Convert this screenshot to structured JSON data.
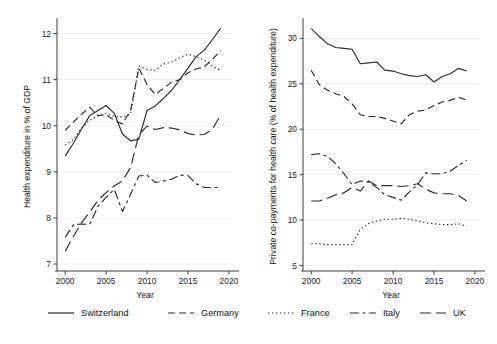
{
  "figure": {
    "title": "",
    "panels": 2,
    "background": "#ffffff",
    "line_color": "#2b2b2b"
  },
  "legend": {
    "position": "bottom",
    "entries": [
      {
        "label": "Switzerland",
        "style": "solid",
        "dash": "none"
      },
      {
        "label": "Germany",
        "style": "dashed",
        "dash": "7,4"
      },
      {
        "label": "France",
        "style": "dotted",
        "dash": "1.4,2.6"
      },
      {
        "label": "Italy",
        "style": "dash-dot",
        "dash": "9,3.5,3,3.5"
      },
      {
        "label": "UK",
        "style": "long-dash",
        "dash": "11,5"
      }
    ]
  },
  "chart_data": [
    {
      "type": "line",
      "panel": "left",
      "title": "",
      "xlabel": "Year",
      "ylabel": "Health expenditure in % of GDP",
      "xlim": [
        1999,
        2020.5
      ],
      "ylim": [
        6.85,
        12.25
      ],
      "xticks": [
        2000,
        2005,
        2010,
        2015,
        2020
      ],
      "yticks": [
        7,
        8,
        9,
        10,
        11,
        12
      ],
      "grid": "horizontal",
      "legend_position": "bottom",
      "x": [
        2000,
        2001,
        2002,
        2003,
        2004,
        2005,
        2006,
        2007,
        2008,
        2009,
        2010,
        2011,
        2012,
        2013,
        2014,
        2015,
        2016,
        2017,
        2018,
        2019
      ],
      "series": [
        {
          "name": "Switzerland",
          "style": "solid",
          "values": [
            9.34,
            9.62,
            9.93,
            10.22,
            10.33,
            10.44,
            10.27,
            9.82,
            9.67,
            9.71,
            10.33,
            10.43,
            10.59,
            10.77,
            11.0,
            11.25,
            11.5,
            11.64,
            11.87,
            12.12
          ]
        },
        {
          "name": "Germany",
          "style": "dashed",
          "values": [
            9.9,
            10.08,
            10.25,
            10.4,
            10.22,
            10.24,
            10.12,
            10.04,
            10.34,
            11.25,
            10.89,
            10.68,
            10.81,
            10.94,
            11.0,
            11.15,
            11.23,
            11.28,
            11.44,
            11.63
          ]
        },
        {
          "name": "France",
          "style": "dotted",
          "values": [
            9.58,
            9.7,
            9.95,
            10.12,
            10.22,
            10.27,
            10.2,
            10.19,
            10.25,
            11.3,
            11.22,
            11.2,
            11.34,
            11.38,
            11.48,
            11.55,
            11.5,
            11.42,
            11.29,
            11.2
          ]
        },
        {
          "name": "Italy",
          "style": "dash-dot",
          "values": [
            7.58,
            7.85,
            7.87,
            7.86,
            8.25,
            8.45,
            8.62,
            8.14,
            8.52,
            8.91,
            8.93,
            8.77,
            8.8,
            8.84,
            8.93,
            8.92,
            8.74,
            8.66,
            8.66,
            8.66
          ]
        },
        {
          "name": "UK",
          "style": "long-dash",
          "values": [
            7.28,
            7.6,
            7.9,
            8.13,
            8.38,
            8.55,
            8.7,
            8.8,
            9.1,
            9.81,
            9.99,
            9.92,
            9.96,
            9.95,
            9.91,
            9.83,
            9.8,
            9.81,
            9.93,
            10.24
          ]
        }
      ]
    },
    {
      "type": "line",
      "panel": "right",
      "title": "",
      "xlabel": "Year",
      "ylabel": "Private co-payments for health care (% of health expenditure)",
      "xlim": [
        1999,
        2020.5
      ],
      "ylim": [
        4.4,
        31.8
      ],
      "xticks": [
        2000,
        2005,
        2010,
        2015,
        2020
      ],
      "yticks": [
        5,
        10,
        15,
        20,
        25,
        30
      ],
      "grid": "horizontal",
      "legend_position": "bottom",
      "x": [
        2000,
        2001,
        2002,
        2003,
        2004,
        2005,
        2006,
        2007,
        2008,
        2009,
        2010,
        2011,
        2012,
        2013,
        2014,
        2015,
        2016,
        2017,
        2018,
        2019
      ],
      "series": [
        {
          "name": "Switzerland",
          "style": "solid",
          "values": [
            31.1,
            30.2,
            29.4,
            29.0,
            28.9,
            28.8,
            27.2,
            27.3,
            27.4,
            26.5,
            26.4,
            26.1,
            25.9,
            25.8,
            26.0,
            25.2,
            25.8,
            26.1,
            26.7,
            26.4
          ]
        },
        {
          "name": "Germany",
          "style": "dashed",
          "values": [
            26.5,
            24.9,
            24.3,
            23.9,
            23.6,
            22.8,
            21.6,
            21.4,
            21.4,
            21.2,
            20.9,
            20.6,
            21.6,
            22.0,
            22.1,
            22.6,
            23.0,
            23.2,
            23.5,
            23.2
          ]
        },
        {
          "name": "France",
          "style": "dotted",
          "values": [
            7.4,
            7.4,
            7.3,
            7.3,
            7.3,
            7.3,
            9.0,
            9.6,
            9.9,
            10.1,
            10.1,
            10.2,
            10.1,
            9.9,
            9.7,
            9.6,
            9.5,
            9.5,
            9.6,
            9.3
          ]
        },
        {
          "name": "Italy",
          "style": "dash-dot",
          "values": [
            17.2,
            17.3,
            17.0,
            16.2,
            15.1,
            13.9,
            14.3,
            14.2,
            13.6,
            12.8,
            12.5,
            12.2,
            13.1,
            13.9,
            15.2,
            15.1,
            15.1,
            15.4,
            16.0,
            16.6
          ]
        },
        {
          "name": "UK",
          "style": "long-dash",
          "values": [
            12.1,
            12.1,
            12.4,
            12.8,
            13.0,
            13.6,
            13.2,
            14.3,
            13.8,
            13.8,
            13.8,
            13.7,
            13.8,
            14.0,
            13.4,
            13.0,
            12.9,
            12.9,
            12.7,
            12.1
          ]
        }
      ]
    }
  ]
}
